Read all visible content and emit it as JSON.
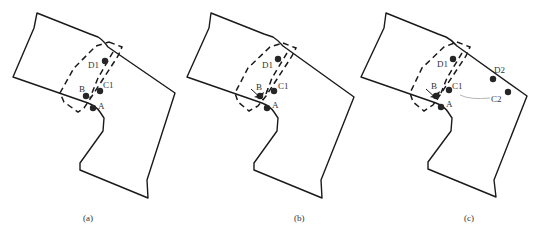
{
  "figure": {
    "panels": [
      {
        "caption": "(a)",
        "points": {
          "A": "A",
          "B": "B",
          "C1": "C1",
          "D1": "D1"
        }
      },
      {
        "caption": "(b)",
        "points": {
          "A": "A",
          "B": "B",
          "C1": "C1",
          "D1": "D1"
        }
      },
      {
        "caption": "(c)",
        "points": {
          "A": "A",
          "B": "B",
          "C1": "C1",
          "D1": "D1",
          "D2": "D2",
          "C2": "C2"
        }
      }
    ]
  }
}
